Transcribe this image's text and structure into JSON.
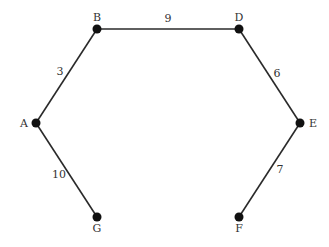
{
  "graph": {
    "nodes": [
      {
        "id": "A",
        "label": "A",
        "x": 36,
        "y": 123,
        "lx": 24,
        "ly": 127,
        "anchor": "middle"
      },
      {
        "id": "B",
        "label": "B",
        "x": 97,
        "y": 29,
        "lx": 97,
        "ly": 21,
        "anchor": "middle"
      },
      {
        "id": "D",
        "label": "D",
        "x": 239,
        "y": 29,
        "lx": 239,
        "ly": 21,
        "anchor": "middle"
      },
      {
        "id": "E",
        "label": "E",
        "x": 300,
        "y": 123,
        "lx": 313,
        "ly": 127,
        "anchor": "middle"
      },
      {
        "id": "F",
        "label": "F",
        "x": 239,
        "y": 217,
        "lx": 239,
        "ly": 232,
        "anchor": "middle"
      },
      {
        "id": "G",
        "label": "G",
        "x": 97,
        "y": 217,
        "lx": 97,
        "ly": 232,
        "anchor": "middle"
      }
    ],
    "edges": [
      {
        "from": "A",
        "to": "B",
        "weight": "3",
        "lx": 60,
        "ly": 75
      },
      {
        "from": "B",
        "to": "D",
        "weight": "9",
        "lx": 168,
        "ly": 22
      },
      {
        "from": "D",
        "to": "E",
        "weight": "6",
        "lx": 277,
        "ly": 77
      },
      {
        "from": "E",
        "to": "F",
        "weight": "7",
        "lx": 280,
        "ly": 173
      },
      {
        "from": "A",
        "to": "G",
        "weight": "10",
        "lx": 59,
        "ly": 178
      }
    ],
    "colors": {
      "edge": "#2a2a2a",
      "node": "#111111",
      "label": "#333333"
    }
  }
}
